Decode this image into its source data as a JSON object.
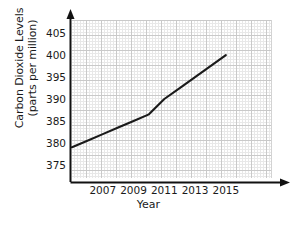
{
  "chart_data": {
    "type": "line",
    "title": "",
    "xlabel": "Year",
    "ylabel_line1": "Carbon Dioxide Levels",
    "ylabel_line2": "(parts per million)",
    "x": [
      2005,
      2006,
      2007,
      2008,
      2009,
      2010,
      2011,
      2012,
      2013,
      2014,
      2015
    ],
    "values": [
      379,
      380.5,
      382,
      383.5,
      385,
      386.5,
      390,
      392.5,
      395,
      397.5,
      400
    ],
    "xticks": [
      "2007",
      "2009",
      "2011",
      "2013",
      "2015"
    ],
    "xtick_values": [
      2007,
      2009,
      2011,
      2013,
      2015
    ],
    "yticks": [
      "375",
      "380",
      "385",
      "390",
      "395",
      "400",
      "405"
    ],
    "ytick_values": [
      375,
      380,
      385,
      390,
      395,
      400,
      405
    ],
    "xlim": [
      2005,
      2018
    ],
    "ylim": [
      372,
      408
    ],
    "grid": true,
    "legend": "none",
    "line_color": "#1a1a1a",
    "grid_major_color": "#c9c9c9",
    "grid_minor_color": "#e8e8e8",
    "axis_color": "#111111"
  }
}
